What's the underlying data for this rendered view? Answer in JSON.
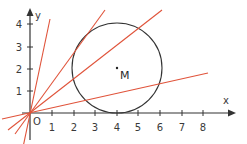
{
  "figure": {
    "type": "coordinate-geometry",
    "axes": {
      "x_label": "x",
      "y_label": "y",
      "origin_label": "O",
      "x_ticks": [
        "1",
        "2",
        "3",
        "4",
        "5",
        "6",
        "7",
        "8"
      ],
      "y_ticks": [
        "1",
        "2",
        "3",
        "4"
      ]
    },
    "circle": {
      "center_label": "M",
      "center": [
        4,
        2
      ],
      "radius": 2,
      "stroke": "#333333"
    },
    "lines": [
      {
        "name": "line-steepest",
        "through": [
          0,
          0
        ],
        "end": [
          0.9,
          4.3
        ]
      },
      {
        "name": "line-tangent-upper",
        "through": [
          0,
          0
        ],
        "end": [
          3.4,
          4.7
        ]
      },
      {
        "name": "line-secant",
        "through": [
          0,
          0
        ],
        "end": [
          6.1,
          4.7
        ]
      },
      {
        "name": "line-tangent-lower",
        "through": [
          0,
          0
        ],
        "end": [
          8.2,
          1.8
        ]
      }
    ],
    "colors": {
      "line": "#e0533a",
      "axis": "#333333",
      "circle": "#333333"
    }
  }
}
